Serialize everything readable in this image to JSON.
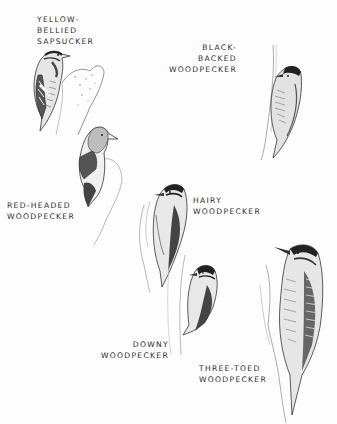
{
  "plate": {
    "species": [
      {
        "id": "yellow-bellied-sapsucker",
        "lines": [
          "YELLOW-",
          "BELLIED",
          "SAPSUCKER"
        ]
      },
      {
        "id": "black-backed-woodpecker",
        "lines": [
          "BLACK-",
          "BACKED",
          "WOODPECKER"
        ]
      },
      {
        "id": "red-headed-woodpecker",
        "lines": [
          "RED-HEADED",
          "WOODPECKER"
        ]
      },
      {
        "id": "hairy-woodpecker",
        "lines": [
          "HAIRY",
          "WOODPECKER"
        ]
      },
      {
        "id": "downy-woodpecker",
        "lines": [
          "DOWNY",
          "WOODPECKER"
        ]
      },
      {
        "id": "three-toed-woodpecker",
        "lines": [
          "THREE-TOED",
          "WOODPECKER"
        ]
      }
    ]
  }
}
